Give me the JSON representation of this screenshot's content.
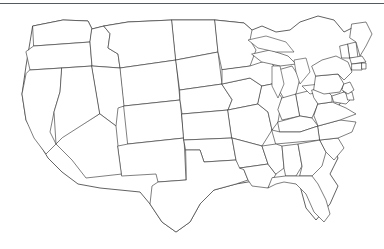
{
  "figure": {
    "kind": "map",
    "background_color": "#ffffff",
    "outline_color": "#3a3a3a",
    "rule_color": "#555a5e",
    "stipple_color": "#8a8a8a",
    "width": 384,
    "height": 249
  },
  "top_rule": {
    "present": true,
    "y": 3,
    "thickness": 1,
    "color": "#555a5e"
  },
  "map": {
    "projection_note": "Contiguous 48 states, simplified line drawing",
    "region_count": 48,
    "regions": [
      "Washington",
      "Oregon",
      "California",
      "Nevada",
      "Idaho",
      "Montana",
      "Wyoming",
      "Utah",
      "Arizona",
      "Colorado",
      "New Mexico",
      "North Dakota",
      "South Dakota",
      "Nebraska",
      "Kansas",
      "Oklahoma",
      "Texas",
      "Minnesota",
      "Iowa",
      "Missouri",
      "Arkansas",
      "Louisiana",
      "Wisconsin",
      "Illinois",
      "Michigan",
      "Indiana",
      "Ohio",
      "Kentucky",
      "Tennessee",
      "Mississippi",
      "Alabama",
      "Georgia",
      "Florida",
      "South Carolina",
      "North Carolina",
      "Virginia",
      "West Virginia",
      "Maryland",
      "Delaware",
      "Pennsylvania",
      "New Jersey",
      "New York",
      "Connecticut",
      "Rhode Island",
      "Massachusetts",
      "Vermont",
      "New Hampshire",
      "Maine"
    ],
    "lakes": [
      "Lake Superior",
      "Lake Michigan",
      "Lake Huron",
      "Lake Erie",
      "Lake Ontario"
    ]
  },
  "bands": [
    {
      "id": "northern-band",
      "label": "Northern shaded band",
      "fill_pattern": "stipple",
      "fill_color": "#8a8a8a",
      "orientation": "west-northwest to east-southeast",
      "crosses": [
        "Montana",
        "North Dakota",
        "South Dakota",
        "Minnesota",
        "Iowa",
        "Wisconsin",
        "Illinois",
        "Missouri",
        "Indiana",
        "Kentucky",
        "Tennessee",
        "Virginia",
        "North Carolina"
      ],
      "entry_point": "northern Rocky Mountains",
      "exit_point": "mid-Atlantic coast"
    },
    {
      "id": "southern-band",
      "label": "Southern shaded band",
      "fill_pattern": "stipple",
      "fill_color": "#8a8a8a",
      "orientation": "west to east-northeast",
      "crosses": [
        "California",
        "Arizona",
        "New Mexico",
        "Texas",
        "Oklahoma",
        "Arkansas",
        "Louisiana",
        "Mississippi",
        "Alabama",
        "Georgia",
        "South Carolina"
      ],
      "entry_point": "southern California / lower Colorado River",
      "exit_point": "southeastern Atlantic coast"
    }
  ],
  "markers": [
    {
      "id": "marker-1",
      "shape": "wedge",
      "near": "Montana / North Dakota border"
    },
    {
      "id": "marker-2",
      "shape": "wedge",
      "near": "Nebraska / Iowa"
    },
    {
      "id": "marker-3",
      "shape": "wedge",
      "near": "Kansas / Missouri"
    },
    {
      "id": "marker-4",
      "shape": "wedge",
      "near": "lower Colorado River"
    }
  ]
}
